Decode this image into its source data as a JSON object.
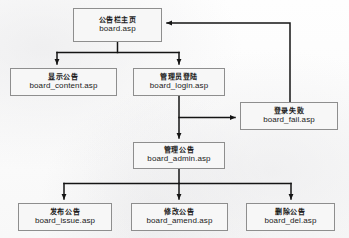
{
  "diagram": {
    "type": "flowchart",
    "canvas": {
      "width": 349,
      "height": 238
    },
    "style": {
      "box_border_color": "#8e8e8e",
      "box_fill_color": "#f7f7f7",
      "line_color": "#1a1a1a",
      "page_background": "#fdfdfd"
    },
    "nodes": [
      {
        "id": "board",
        "cn": "公告栏主页",
        "file": "board.asp",
        "x": 73,
        "y": 8,
        "w": 89,
        "h": 34
      },
      {
        "id": "content",
        "cn": "显示公告",
        "file": "board_content.asp",
        "x": 10,
        "y": 68,
        "w": 107,
        "h": 28
      },
      {
        "id": "login",
        "cn": "管理员登陆",
        "file": "board_login.asp",
        "x": 133,
        "y": 68,
        "w": 92,
        "h": 28
      },
      {
        "id": "fail",
        "cn": "登录失败",
        "file": "board_fail.asp",
        "x": 240,
        "y": 102,
        "w": 98,
        "h": 28
      },
      {
        "id": "admin",
        "cn": "管理公告",
        "file": "board_admin.asp",
        "x": 133,
        "y": 142,
        "w": 92,
        "h": 27
      },
      {
        "id": "issue",
        "cn": "发布公告",
        "file": "board_issue.asp",
        "x": 18,
        "y": 203,
        "w": 94,
        "h": 28
      },
      {
        "id": "amend",
        "cn": "修改公告",
        "file": "board_amend.asp",
        "x": 131,
        "y": 203,
        "w": 97,
        "h": 28
      },
      {
        "id": "del",
        "cn": "删除公告",
        "file": "board_del.asp",
        "x": 246,
        "y": 203,
        "w": 89,
        "h": 28
      }
    ],
    "edges": [
      {
        "from": "board",
        "to": "content",
        "label": ""
      },
      {
        "from": "board",
        "to": "login",
        "label": ""
      },
      {
        "from": "login",
        "to": "fail",
        "label": ""
      },
      {
        "from": "login",
        "to": "admin",
        "label": ""
      },
      {
        "from": "fail",
        "to": "board",
        "label": ""
      },
      {
        "from": "admin",
        "to": "issue",
        "label": ""
      },
      {
        "from": "admin",
        "to": "amend",
        "label": ""
      },
      {
        "from": "admin",
        "to": "del",
        "label": ""
      }
    ]
  }
}
